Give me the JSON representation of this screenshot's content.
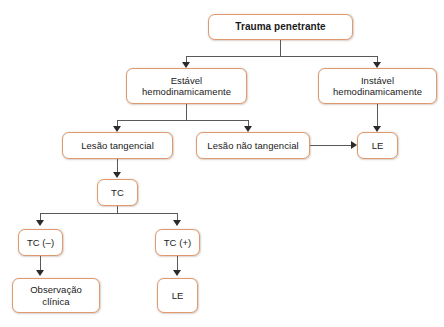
{
  "diagram": {
    "colors": {
      "node_border": "#e09a6e",
      "node_fill": "#ffffff",
      "connector": "#595959",
      "arrow": "#2b2b2b",
      "text": "#1a1a1a",
      "background": "#ffffff"
    },
    "nodes": {
      "root": {
        "label": "Trauma penetrante"
      },
      "stable": {
        "line1": "Estável",
        "line2": "hemodinamicamente"
      },
      "unstable": {
        "line1": "Instável",
        "line2": "hemodinamicamente"
      },
      "tangential": {
        "label": "Lesão tangencial"
      },
      "non_tangential": {
        "label": "Lesão não tangencial"
      },
      "le_right": {
        "label": "LE"
      },
      "tc": {
        "label": "TC"
      },
      "tc_negative": {
        "label": "TC (–)"
      },
      "tc_positive": {
        "label": "TC (+)"
      },
      "observation": {
        "line1": "Observação",
        "line2": "clínica"
      },
      "le_bottom": {
        "label": "LE"
      }
    }
  }
}
